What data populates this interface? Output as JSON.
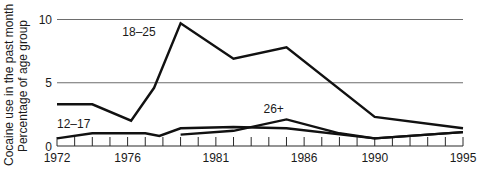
{
  "chart_data": {
    "type": "line",
    "title": "",
    "xlabel": "",
    "ylabel": [
      "Cocaine use in the past month",
      "Percentage of age group"
    ],
    "xlim": [
      1972,
      1995
    ],
    "ylim": [
      0,
      10
    ],
    "x_tick_labels": [
      "1972",
      "1976",
      "1981",
      "1986",
      "1990",
      "1995"
    ],
    "y_tick_labels": [
      "0",
      "5",
      "10"
    ],
    "y_gridlines": [
      5,
      10
    ],
    "minor_x_ticks_every": 1,
    "series": [
      {
        "name": "18–25",
        "label_position": {
          "x": 1975.7,
          "y": 8.7
        },
        "points": [
          [
            1972,
            3.3
          ],
          [
            1974,
            3.3
          ],
          [
            1976.2,
            2.0
          ],
          [
            1977.5,
            4.6
          ],
          [
            1979,
            9.7
          ],
          [
            1982,
            6.9
          ],
          [
            1985,
            7.8
          ],
          [
            1990,
            2.3
          ],
          [
            1995,
            1.4
          ]
        ]
      },
      {
        "name": "12–17",
        "label_position": {
          "x": 1972,
          "y": 1.45
        },
        "points": [
          [
            1972,
            0.6
          ],
          [
            1974,
            1.0
          ],
          [
            1977,
            1.0
          ],
          [
            1977.8,
            0.8
          ],
          [
            1979,
            1.4
          ],
          [
            1982,
            1.5
          ],
          [
            1985,
            1.4
          ],
          [
            1990,
            0.6
          ],
          [
            1995,
            1.1
          ]
        ]
      },
      {
        "name": "26+",
        "label_position": {
          "x": 1983.7,
          "y": 2.6
        },
        "points": [
          [
            1979,
            0.9
          ],
          [
            1982,
            1.2
          ],
          [
            1985,
            2.1
          ],
          [
            1988,
            1.0
          ],
          [
            1990,
            0.6
          ],
          [
            1995,
            1.1
          ]
        ]
      }
    ]
  }
}
